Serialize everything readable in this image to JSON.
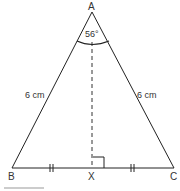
{
  "diagram": {
    "type": "isosceles-triangle",
    "vertices": {
      "A": "A",
      "B": "B",
      "C": "C",
      "X": "X"
    },
    "angle_label": "56°",
    "side_labels": {
      "AB": "6 cm",
      "AC": "6 cm"
    },
    "markings": {
      "BX_CX_equal": "tick-double",
      "AX_perpendicular_BC": "right-angle",
      "AX_style": "dashed"
    }
  }
}
